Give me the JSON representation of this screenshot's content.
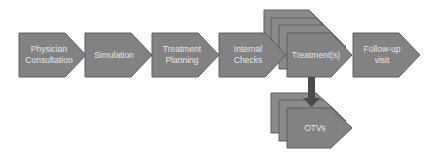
{
  "diagram": {
    "type": "process-flow",
    "colors": {
      "shape_fill": "#828282",
      "shape_stroke": "#5e5e5e",
      "stack_fill": "#8a8a8a",
      "arrow": "#4a4a4a",
      "text": "#e6e6e6",
      "background": "#ffffff"
    },
    "steps": [
      {
        "id": "physician-consultation",
        "label": "Physician Consultation",
        "line1": "Physician",
        "line2": "Consultation"
      },
      {
        "id": "simulation",
        "label": "Simulation",
        "line1": "Simulation",
        "line2": ""
      },
      {
        "id": "treatment-planning",
        "label": "Treatment Planning",
        "line1": "Treatment",
        "line2": "Planning"
      },
      {
        "id": "internal-checks",
        "label": "Internal Checks",
        "line1": "Internal",
        "line2": "Checks"
      },
      {
        "id": "treatments",
        "label": "Treatment(s)",
        "line1": "Treatment(s)",
        "line2": "",
        "stacked": true,
        "stack_count": 4
      },
      {
        "id": "follow-up-visit",
        "label": "Follow-up visit",
        "line1": "Follow-up",
        "line2": "visit"
      }
    ],
    "branch": {
      "from": "treatments",
      "to": {
        "id": "otvs",
        "label": "OTVs",
        "stacked": true,
        "stack_count": 3
      },
      "direction": "down"
    }
  }
}
